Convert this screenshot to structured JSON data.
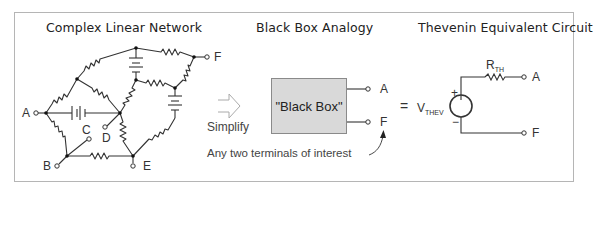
{
  "sections": {
    "network": {
      "title": "Complex Linear Network",
      "nodes": [
        "A",
        "B",
        "C",
        "D",
        "E",
        "F"
      ]
    },
    "black_box": {
      "title": "Black Box Analogy",
      "box_label": "\"Black Box\"",
      "terminals": [
        "A",
        "F"
      ],
      "simplify_label": "Simplify",
      "annotation": "Any two terminals of interest"
    },
    "thevenin": {
      "title": "Thevenin Equivalent Circuit",
      "equals": "=",
      "resistor": {
        "main": "R",
        "sub": "TH"
      },
      "source": {
        "main": "V",
        "sub": "THEV"
      },
      "plus": "+",
      "minus": "−",
      "terminals": [
        "A",
        "F"
      ]
    }
  },
  "colors": {
    "frame": "#b5b5b5",
    "line": "#333333",
    "box_fill": "#d9d9d9",
    "arrow": "#aaaaaa"
  }
}
